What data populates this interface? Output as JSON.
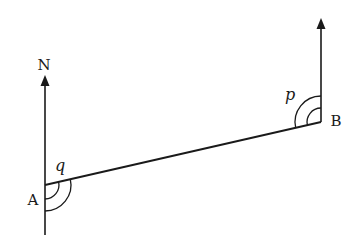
{
  "diagram": {
    "type": "bearing-diagram",
    "colors": {
      "stroke": "#1a1a1a",
      "background": "#ffffff"
    },
    "labels": {
      "north": "N",
      "point_a": "A",
      "point_b": "B",
      "angle_at_a": "q",
      "angle_at_b": "p"
    },
    "points": {
      "A": [
        45,
        185
      ],
      "B": [
        321,
        122
      ]
    },
    "north_lines": [
      {
        "at": "A",
        "from": [
          45,
          235
        ],
        "to": [
          45,
          75
        ],
        "arrow": true
      },
      {
        "at": "B",
        "from": [
          321,
          122
        ],
        "to": [
          321,
          18
        ],
        "arrow": true
      }
    ],
    "segment": {
      "from": "A",
      "to": "B"
    },
    "angle_marks": [
      {
        "at": "A",
        "label": "q",
        "arcs": 2,
        "radii": [
          14,
          26
        ]
      },
      {
        "at": "B",
        "label": "p",
        "arcs": 2,
        "radii": [
          14,
          26
        ]
      }
    ]
  }
}
